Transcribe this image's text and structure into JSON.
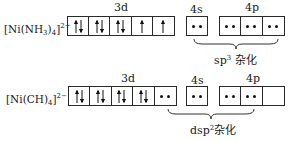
{
  "rows": [
    {
      "ion": {
        "base": "[Ni(NH",
        "sub1": "3",
        "mid": ")",
        "sub2": "4",
        "end": "]",
        "charge": "2+"
      },
      "orbital_labels": {
        "d": "3d",
        "s": "4s",
        "p": "4p"
      },
      "d_orbitals": [
        "up-down",
        "up-down",
        "up-down",
        "up",
        "up"
      ],
      "s_orbitals": [
        "pair"
      ],
      "p_orbitals": [
        "pair",
        "pair",
        "pair"
      ],
      "hybridization": {
        "prefix": "sp",
        "sup": "3",
        "suffix": " 杂化"
      }
    },
    {
      "ion": {
        "base": "[Ni(CH)",
        "sub1": "",
        "mid": "",
        "sub2": "4",
        "end": "]",
        "charge": "2−"
      },
      "orbital_labels": {
        "d": "3d",
        "s": "4s",
        "p": "4p"
      },
      "d_orbitals": [
        "up-down",
        "up-down",
        "up-down",
        "up-down",
        "pair"
      ],
      "s_orbitals": [
        "pair"
      ],
      "p_orbitals": [
        "pair",
        "pair",
        "empty"
      ],
      "hybridization": {
        "prefix": "dsp",
        "sup": "2",
        "suffix": "杂化"
      }
    }
  ]
}
